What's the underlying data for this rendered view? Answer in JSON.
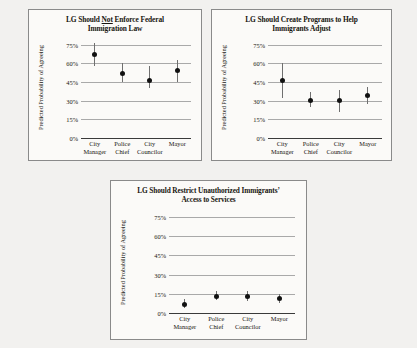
{
  "figure": {
    "ylabel": "Predicted Probability of Agreeing",
    "categories": [
      "City Manager",
      "Police Chief",
      "City Councilor",
      "Mayor"
    ],
    "yticks": [
      "0%",
      "15%",
      "30%",
      "45%",
      "60%",
      "75%"
    ]
  },
  "panels": [
    {
      "title_line1_pre": "LG Should ",
      "title_line1_underlined": "Not",
      "title_line1_post": " Enforce Federal",
      "title_line2": "Immigration Law"
    },
    {
      "title_line1": "LG Should Create Programs to Help",
      "title_line2": "Immigrants Adjust"
    },
    {
      "title_line1": "LG Should Restrict Unauthorized Immigrants’",
      "title_line2": "Access to Services"
    }
  ],
  "chart_data": [
    {
      "type": "scatter",
      "title": "LG Should Not Enforce Federal Immigration Law",
      "xlabel": "",
      "ylabel": "Predicted Probability of Agreeing",
      "ylim": [
        0,
        78
      ],
      "yticks": [
        0,
        15,
        30,
        45,
        60,
        75
      ],
      "ytick_labels": [
        "0%",
        "15%",
        "30%",
        "45%",
        "60%",
        "75%"
      ],
      "grid": true,
      "legend": "none",
      "categories": [
        "City Manager",
        "Police Chief",
        "City Councilor",
        "Mayor"
      ],
      "values": [
        67,
        52,
        46,
        54
      ],
      "ci_low": [
        58,
        45,
        40,
        45
      ],
      "ci_high": [
        76,
        60,
        58,
        63
      ]
    },
    {
      "type": "scatter",
      "title": "LG Should Create Programs to Help Immigrants Adjust",
      "xlabel": "",
      "ylabel": "Predicted Probability of Agreeing",
      "ylim": [
        0,
        78
      ],
      "yticks": [
        0,
        15,
        30,
        45,
        60,
        75
      ],
      "ytick_labels": [
        "0%",
        "15%",
        "30%",
        "45%",
        "60%",
        "75%"
      ],
      "grid": true,
      "legend": "none",
      "categories": [
        "City Manager",
        "Police Chief",
        "City Councilor",
        "Mayor"
      ],
      "values": [
        46,
        30,
        30,
        34
      ],
      "ci_low": [
        32,
        25,
        21,
        27
      ],
      "ci_high": [
        60,
        37,
        39,
        41
      ]
    },
    {
      "type": "scatter",
      "title": "LG Should Restrict Unauthorized Immigrants’ Access to Services",
      "xlabel": "",
      "ylabel": "Predicted Probability of Agreeing",
      "ylim": [
        0,
        78
      ],
      "yticks": [
        0,
        15,
        30,
        45,
        60,
        75
      ],
      "ytick_labels": [
        "0%",
        "15%",
        "30%",
        "45%",
        "60%",
        "75%"
      ],
      "grid": true,
      "legend": "none",
      "categories": [
        "City Manager",
        "Police Chief",
        "City Councilor",
        "Mayor"
      ],
      "values": [
        7,
        13,
        13,
        11
      ],
      "ci_low": [
        4,
        10,
        9,
        8
      ],
      "ci_high": [
        11,
        17,
        17,
        15
      ]
    }
  ]
}
